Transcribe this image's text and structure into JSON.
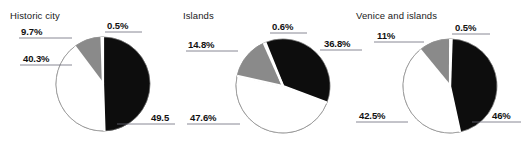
{
  "figure": {
    "background": "#ffffff",
    "label_color": "#111111",
    "title_color": "#1a1a1a",
    "leader_line_color": "#6b6b78",
    "slice_colors": {
      "black": "#0d0d0d",
      "white": "#ffffff",
      "grey": "#8a8a8a",
      "sliver": "#f2f2f2",
      "outline": "#8f8f8f",
      "separator": "#ffffff"
    }
  },
  "chart_data": [
    {
      "type": "pie",
      "title": "Historic city",
      "categories": [
        "49.5%",
        "40.3%",
        "9.7%",
        "0.5%"
      ],
      "values": [
        49.5,
        40.3,
        9.7,
        0.5
      ],
      "colors": [
        "#0d0d0d",
        "#ffffff",
        "#8a8a8a",
        "#f2f2f2"
      ],
      "labels": [
        "49.5",
        "40.3%",
        "9.7%",
        "0.5%"
      ],
      "start_angle": 0,
      "legend": "none",
      "grid": false
    },
    {
      "type": "pie",
      "title": "Islands",
      "categories": [
        "36.8%",
        "47.6%",
        "14.8%",
        "0.6%"
      ],
      "values": [
        36.8,
        47.6,
        14.8,
        0.6
      ],
      "colors": [
        "#0d0d0d",
        "#ffffff",
        "#8a8a8a",
        "#f2f2f2"
      ],
      "labels": [
        "36.8%",
        "47.6%",
        "14.8%",
        "0.6%"
      ],
      "start_angle": -22,
      "legend": "none",
      "grid": false
    },
    {
      "type": "pie",
      "title": "Venice and islands",
      "categories": [
        "46%",
        "42.5%",
        "11%",
        "0.5%"
      ],
      "values": [
        46.0,
        42.5,
        11.0,
        0.5
      ],
      "colors": [
        "#0d0d0d",
        "#ffffff",
        "#8a8a8a",
        "#f2f2f2"
      ],
      "labels": [
        "46%",
        "42.5%",
        "11%",
        "0.5%"
      ],
      "start_angle": 2,
      "legend": "none",
      "grid": false
    }
  ],
  "panels": [
    {
      "title": "Historic city",
      "title_x": 10,
      "title_y": 10,
      "cx": 103,
      "cy": 84,
      "r": 47,
      "start_angle": 0,
      "values": [
        49.5,
        40.3,
        9.7,
        0.5
      ],
      "colors": [
        "#0d0d0d",
        "#ffffff",
        "#8a8a8a",
        "#f2f2f2"
      ],
      "labels": [
        {
          "text": "0.5%",
          "x": 107,
          "y": 20,
          "line_x1": 105,
          "line_x2": 142,
          "line_y": 32,
          "anchor": "left"
        },
        {
          "text": "49.5",
          "x": 151,
          "y": 112,
          "line_x1": 117,
          "line_x2": 175,
          "line_y": 124,
          "anchor": "left"
        },
        {
          "text": "40.3%",
          "x": 23,
          "y": 53,
          "line_x1": 20,
          "line_x2": 72,
          "line_y": 65,
          "anchor": "left"
        },
        {
          "text": "9.7%",
          "x": 21,
          "y": 26,
          "line_x1": 19,
          "line_x2": 72,
          "line_y": 38,
          "anchor": "left"
        }
      ]
    },
    {
      "title": "Islands",
      "title_x": 183,
      "title_y": 10,
      "cx": 283,
      "cy": 86,
      "r": 47,
      "start_angle": -22,
      "values": [
        36.8,
        47.6,
        14.8,
        0.6
      ],
      "colors": [
        "#0d0d0d",
        "#ffffff",
        "#8a8a8a",
        "#f2f2f2"
      ],
      "labels": [
        {
          "text": "0.6%",
          "x": 272,
          "y": 21,
          "line_x1": 270,
          "line_x2": 307,
          "line_y": 33,
          "anchor": "left"
        },
        {
          "text": "36.8%",
          "x": 324,
          "y": 38,
          "line_x1": 320,
          "line_x2": 362,
          "line_y": 50,
          "anchor": "left"
        },
        {
          "text": "47.6%",
          "x": 190,
          "y": 112,
          "line_x1": 187,
          "line_x2": 240,
          "line_y": 124,
          "anchor": "left"
        },
        {
          "text": "14.8%",
          "x": 188,
          "y": 39,
          "line_x1": 186,
          "line_x2": 238,
          "line_y": 51,
          "anchor": "left"
        }
      ]
    },
    {
      "title": "Venice and islands",
      "title_x": 356,
      "title_y": 10,
      "cx": 450,
      "cy": 86,
      "r": 47,
      "start_angle": 2,
      "values": [
        46.0,
        42.5,
        11.0,
        0.5
      ],
      "colors": [
        "#0d0d0d",
        "#ffffff",
        "#8a8a8a",
        "#f2f2f2"
      ],
      "labels": [
        {
          "text": "0.5%",
          "x": 455,
          "y": 22,
          "line_x1": 452,
          "line_x2": 490,
          "line_y": 34,
          "anchor": "left"
        },
        {
          "text": "46%",
          "x": 492,
          "y": 110,
          "line_x1": 472,
          "line_x2": 521,
          "line_y": 122,
          "anchor": "left"
        },
        {
          "text": "42.5%",
          "x": 359,
          "y": 110,
          "line_x1": 356,
          "line_x2": 408,
          "line_y": 122,
          "anchor": "left"
        },
        {
          "text": "11%",
          "x": 377,
          "y": 30,
          "line_x1": 374,
          "line_x2": 424,
          "line_y": 42,
          "anchor": "left"
        }
      ]
    }
  ]
}
